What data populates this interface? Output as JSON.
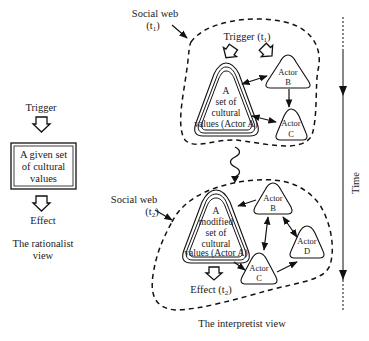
{
  "rationalist": {
    "trigger": "Trigger",
    "box_lines": [
      "A given set",
      "of cultural",
      "values"
    ],
    "effect": "Effect",
    "caption_lines": [
      "The rationalist",
      "view"
    ]
  },
  "interpretist": {
    "web1": {
      "label": "Social web",
      "time": "(t",
      "sub": "1",
      "close": ")"
    },
    "trigger1": {
      "label": "Trigger (t",
      "sub": "1",
      "close": ")"
    },
    "actorA1_lines": [
      "A",
      "set of",
      "cultural",
      "values (Actor A)"
    ],
    "actorB1": [
      "Actor",
      "B"
    ],
    "actorC1": [
      "Actor",
      "C"
    ],
    "web2": {
      "label": "Social web",
      "time": "(t",
      "sub": "2",
      "close": ")"
    },
    "actorA2_lines": [
      "A",
      "modified",
      "set of",
      "cultural",
      "values (Actor A)"
    ],
    "actorB2": [
      "Actor",
      "B"
    ],
    "actorC2": [
      "Actor",
      "C"
    ],
    "actorD2": [
      "Actor",
      "D"
    ],
    "effect2": {
      "label": "Effect (t",
      "sub": "2",
      "close": ")"
    },
    "caption": "The interpretist view"
  },
  "time_axis": {
    "label": "Time"
  }
}
